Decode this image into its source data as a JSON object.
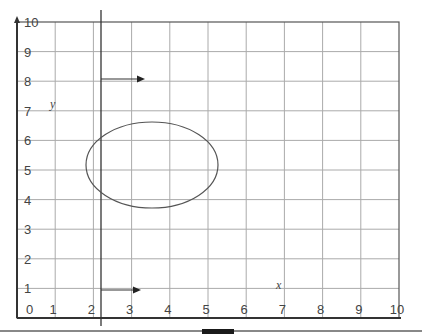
{
  "diagram": {
    "title": "",
    "x_axis": {
      "label": "x",
      "ticks": [
        "0",
        "1",
        "2",
        "3",
        "4",
        "5",
        "6",
        "7",
        "8",
        "9",
        "10"
      ]
    },
    "y_axis": {
      "label": "y",
      "ticks": [
        "1",
        "2",
        "3",
        "4",
        "5",
        "6",
        "7",
        "8",
        "9",
        "10"
      ]
    },
    "shapes": {
      "ellipse": {
        "center": [
          3.5,
          5.15
        ],
        "rx_units": 1.75,
        "ry_units": 1.5,
        "stroke": "#555555"
      },
      "vertical_line": {
        "x_units": 2.2,
        "stroke": "#333333"
      },
      "arrows": [
        {
          "from": [
            2.2,
            8
          ],
          "to": [
            3.3,
            8
          ],
          "label": "arrow-at-y8"
        },
        {
          "from": [
            2.2,
            1
          ],
          "to": [
            3.3,
            1
          ],
          "label": "arrow-at-y1"
        }
      ]
    },
    "colors": {
      "grid": "#aaaaaa",
      "axis": "#333333",
      "text": "#444444",
      "footer_bar": "#888888",
      "footer_block": "#1a1a1a"
    }
  }
}
